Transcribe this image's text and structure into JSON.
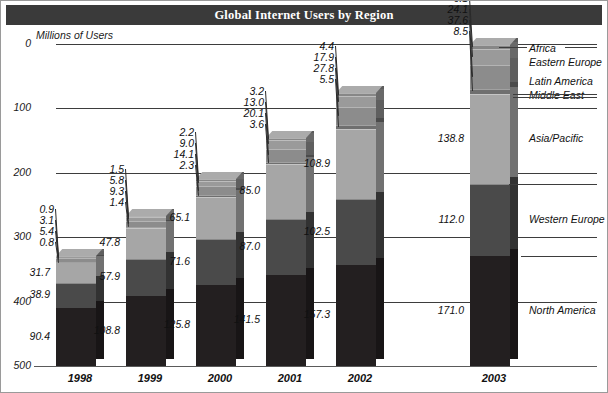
{
  "title": "Global Internet Users by Region",
  "axis": {
    "ytitle": "Millions of Users",
    "yticks": [
      "500",
      "400",
      "300",
      "200",
      "100",
      "0"
    ],
    "xticks": [
      "1998",
      "1999",
      "2000",
      "2001",
      "2002",
      "2003"
    ]
  },
  "legend": [
    "Africa",
    "Eastern Europe",
    "Latin America",
    "Middle East",
    "Asia/Pacific",
    "Western Europe",
    "North America"
  ],
  "labels": {
    "y1998": [
      "0.9",
      "3.1",
      "5.4",
      "0.8",
      "31.7",
      "38.9",
      "90.4"
    ],
    "y1999": [
      "1.5",
      "5.8",
      "9.3",
      "1.4",
      "47.8",
      "57.9",
      "108.8"
    ],
    "y2000": [
      "2.2",
      "9.0",
      "14.1",
      "2.3",
      "65.1",
      "71.6",
      "125.8"
    ],
    "y2001": [
      "3.2",
      "13.0",
      "20.1",
      "3.6",
      "85.0",
      "87.0",
      "141.5"
    ],
    "y2002": [
      "4.4",
      "17.9",
      "27.8",
      "5.5",
      "108.9",
      "102.5",
      "157.3"
    ],
    "y2003": [
      "6.1",
      "24.1",
      "37.6",
      "8.5",
      "138.8",
      "112.0",
      "171.0"
    ]
  },
  "chart_data": {
    "type": "bar",
    "subtype": "stacked-column-3d",
    "title": "Global Internet Users by Region",
    "xlabel": "",
    "ylabel": "Millions of Users",
    "ylim": [
      0,
      500
    ],
    "yticks": [
      0,
      100,
      200,
      300,
      400,
      500
    ],
    "grid": true,
    "legend_position": "right",
    "categories": [
      "1998",
      "1999",
      "2000",
      "2001",
      "2002",
      "2003"
    ],
    "series": [
      {
        "name": "North America",
        "values": [
          90.4,
          108.8,
          125.8,
          141.5,
          157.3,
          171.0
        ],
        "color": "#231f20"
      },
      {
        "name": "Western Europe",
        "values": [
          38.9,
          57.9,
          71.6,
          87.0,
          102.5,
          112.0
        ],
        "color": "#4a4a4a"
      },
      {
        "name": "Asia/Pacific",
        "values": [
          31.7,
          47.8,
          65.1,
          85.0,
          108.9,
          138.8
        ],
        "color": "#a6a6a6"
      },
      {
        "name": "Middle East",
        "values": [
          0.8,
          1.4,
          2.3,
          3.6,
          5.5,
          8.5
        ],
        "color": "#6f6f6f"
      },
      {
        "name": "Latin America",
        "values": [
          5.4,
          9.3,
          14.1,
          20.1,
          27.8,
          37.6
        ],
        "color": "#8c8c8c"
      },
      {
        "name": "Eastern Europe",
        "values": [
          3.1,
          5.8,
          9.0,
          13.0,
          17.9,
          24.1
        ],
        "color": "#9a9a9a"
      },
      {
        "name": "Africa",
        "values": [
          0.9,
          1.5,
          2.2,
          3.2,
          4.4,
          6.1
        ],
        "color": "#878787"
      }
    ],
    "totals": [
      170.2,
      232.5,
      290.1,
      353.4,
      424.3,
      498.1
    ]
  }
}
